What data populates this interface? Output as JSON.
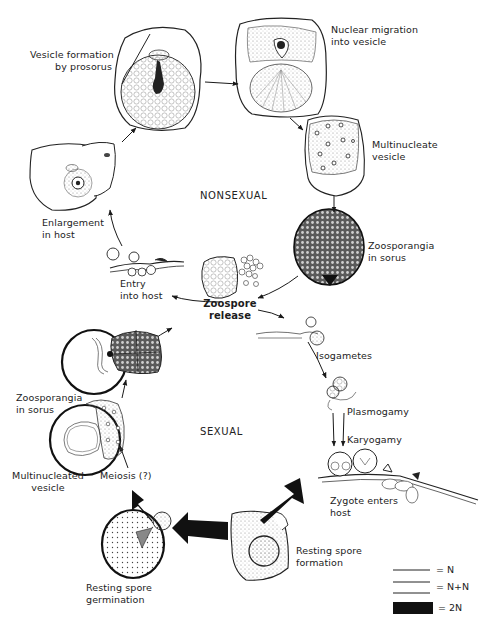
{
  "diagram": {
    "type": "life-cycle",
    "phases": {
      "nonsexual": "NONSEXUAL",
      "sexual": "SEXUAL"
    },
    "stages": {
      "vesicle_formation": [
        "Vesicle formation",
        "by prosorus"
      ],
      "nuclear_migration": [
        "Nuclear migration",
        "into vesicle"
      ],
      "multinucleate_vesicle": [
        "Multinucleate",
        "vesicle"
      ],
      "zoosporangia_sorus_right": [
        "Zoosporangia",
        "in sorus"
      ],
      "enlargement": [
        "Enlargement",
        "in host"
      ],
      "entry": [
        "Entry",
        "into host"
      ],
      "zoospore_release": [
        "Zoospore",
        "release"
      ],
      "isogametes": "Isogametes",
      "plasmogamy": "Plasmogamy",
      "karyogamy": "Karyogamy",
      "zygote": [
        "Zygote enters",
        "host"
      ],
      "resting_spore_formation": [
        "Resting spore",
        "formation"
      ],
      "resting_spore_germination": [
        "Resting spore",
        "germination"
      ],
      "meiosis": "Meiosis (?)",
      "multinucleated_vesicle": [
        "Multinucleated",
        "vesicle"
      ],
      "zoosporangia_sorus_left": [
        "Zoosporangia",
        "in sorus"
      ]
    },
    "legend": [
      {
        "symbol": "single-line",
        "label": "= N"
      },
      {
        "symbol": "double-line",
        "label": "= N+N"
      },
      {
        "symbol": "thick-bar",
        "label": "= 2N"
      }
    ],
    "colors": {
      "ink": "#1a1a1a",
      "stipple": "#8a8a8a",
      "background": "#ffffff"
    }
  }
}
